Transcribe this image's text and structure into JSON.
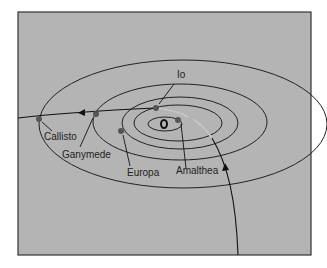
{
  "diagram": {
    "background": "#b4b4b4",
    "labels": {
      "io": "Io",
      "callisto": "Callisto",
      "ganymede": "Ganymede",
      "europa": "Europa",
      "amalthea": "Amalthea"
    }
  }
}
